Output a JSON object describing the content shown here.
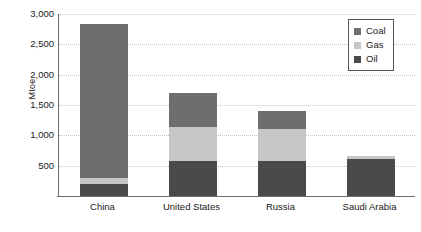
{
  "chart_data": {
    "type": "bar",
    "title": "",
    "subtitle": "",
    "xlabel": "",
    "ylabel": "Mtoe",
    "stacked": true,
    "grid": true,
    "legend_position": "top-right",
    "categories": [
      "China",
      "United States",
      "Russia",
      "Saudi Arabia"
    ],
    "ylim": [
      0,
      3000
    ],
    "yticks": [
      500,
      1000,
      1500,
      2000,
      2500,
      3000
    ],
    "ytick_labels": [
      "500",
      "1,000",
      "1,500",
      "2,000",
      "2,500",
      "3,000"
    ],
    "series": [
      {
        "name": "Oil",
        "color": "#4a4a4a",
        "values": [
          190,
          570,
          580,
          610
        ]
      },
      {
        "name": "Gas",
        "color": "#c6c6c6",
        "values": [
          100,
          570,
          530,
          50
        ]
      },
      {
        "name": "Coal",
        "color": "#6e6e6e",
        "values": [
          2550,
          560,
          300,
          0
        ]
      }
    ],
    "totals": [
      2840,
      1700,
      1410,
      660
    ]
  },
  "legend": {
    "items": [
      {
        "label": "Coal",
        "color": "#6e6e6e"
      },
      {
        "label": "Gas",
        "color": "#c6c6c6"
      },
      {
        "label": "Oil",
        "color": "#4a4a4a"
      }
    ]
  }
}
